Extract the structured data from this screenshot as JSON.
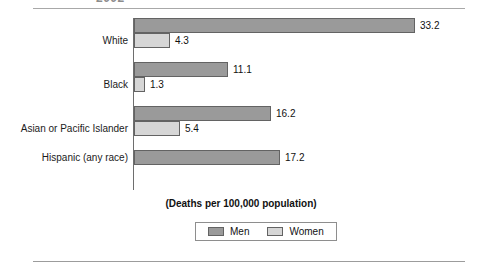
{
  "header": {
    "clipped_title": "2002"
  },
  "chart_data": {
    "type": "bar",
    "orientation": "horizontal",
    "title": "",
    "xlabel": "(Deaths per 100,000 population)",
    "ylabel": "",
    "categories": [
      "White",
      "Black",
      "Asian or Pacific Islander",
      "Hispanic (any race)"
    ],
    "series": [
      {
        "name": "Men",
        "color": "#9a9a9a",
        "values": [
          33.2,
          11.1,
          16.2,
          17.2
        ],
        "labels": [
          "33.2",
          "11.1",
          "16.2",
          "17.2"
        ]
      },
      {
        "name": "Women",
        "color": "#d6d6d6",
        "values": [
          4.3,
          1.3,
          5.4,
          null
        ],
        "labels": [
          "4.3",
          "1.3",
          "5.4",
          ""
        ]
      }
    ],
    "xlim": [
      0,
      33.2
    ],
    "grid": false,
    "legend_position": "bottom",
    "value_labels_shown": true
  },
  "legend": {
    "items": [
      {
        "label": "Men",
        "color": "#9a9a9a"
      },
      {
        "label": "Women",
        "color": "#d6d6d6"
      }
    ]
  },
  "caption": {
    "axis_note": "(Deaths per 100,000 population)"
  },
  "colors": {
    "men": "#9a9a9a",
    "women": "#d6d6d6",
    "bar_border": "#636363",
    "rule": "#a8a8a8",
    "text": "#1b1b1b",
    "background": "#ffffff"
  }
}
